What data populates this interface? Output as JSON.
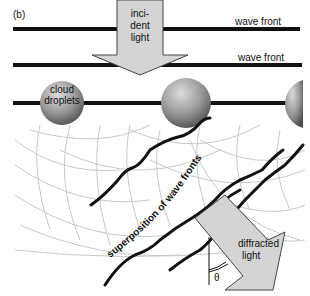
{
  "figure": {
    "panel_label": "(b)",
    "wave_front_label_1": "wave front",
    "wave_front_label_2": "wave front",
    "incident_light": [
      "inci-",
      "dent",
      "light"
    ],
    "cloud_droplets": [
      "cloud",
      "droplets"
    ],
    "superposition_label": "superposition of wave fronts",
    "diffracted_light": [
      "diffracted",
      "light"
    ],
    "angle_symbol": "θ",
    "colors": {
      "line": "#111111",
      "arrow_fill": "#d4d4d4",
      "sphere_dark": "#555555",
      "sphere_light": "#d8d8d8",
      "wavelet": "#c8c8c8"
    }
  }
}
